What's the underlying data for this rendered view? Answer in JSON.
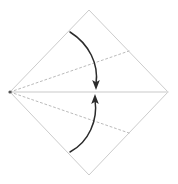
{
  "diagram": {
    "type": "origami-fold-diagram",
    "canvas": {
      "width": 178,
      "height": 184,
      "background": "#ffffff"
    },
    "colors": {
      "paper_edge": "#cccccc",
      "crease_dashed": "#bbbbbb",
      "center_crease": "#dcdcdc",
      "arrow": "#2b2b2b",
      "vertex": "#555555"
    },
    "shape": {
      "name": "square-diamond",
      "vertices": {
        "top": {
          "x": 89,
          "y": 10
        },
        "right": {
          "x": 168,
          "y": 92
        },
        "bottom": {
          "x": 89,
          "y": 175
        },
        "left": {
          "x": 10,
          "y": 92
        }
      },
      "edge_width": 1
    },
    "center_crease": {
      "name": "horizontal-center-crease",
      "style": "solid",
      "from": {
        "x": 10,
        "y": 92
      },
      "to": {
        "x": 168,
        "y": 92
      },
      "width": 1.4
    },
    "fold_lines": [
      {
        "name": "upper-fold-crease",
        "style": "dashed",
        "dash": "2,2.6",
        "from": {
          "x": 10,
          "y": 92
        },
        "to": {
          "x": 129,
          "y": 51
        },
        "width": 1
      },
      {
        "name": "lower-fold-crease",
        "style": "dashed",
        "dash": "2,2.6",
        "from": {
          "x": 10,
          "y": 92
        },
        "to": {
          "x": 129,
          "y": 133
        },
        "width": 1
      }
    ],
    "arrows": [
      {
        "name": "fold-down-arrow",
        "direction": "down",
        "path": "M 70 32 C 89 44, 99 64, 96 84",
        "tip": {
          "x": 96,
          "y": 90
        },
        "width": 1.5
      },
      {
        "name": "fold-up-arrow",
        "direction": "up",
        "path": "M 70 152 C 89 142, 98 120, 95 100",
        "tip": {
          "x": 95,
          "y": 94
        },
        "width": 1.5
      }
    ],
    "vertex_marker": {
      "name": "left-vertex-point",
      "x": 10,
      "y": 92,
      "r": 1.6
    }
  }
}
